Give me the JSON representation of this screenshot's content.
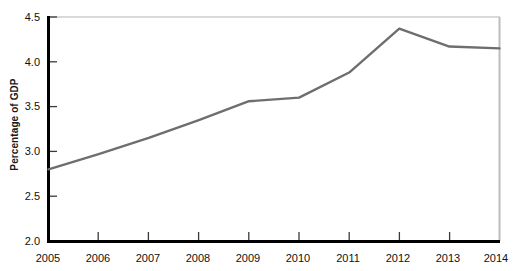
{
  "chart_data": {
    "type": "line",
    "title": "",
    "subtitle": "",
    "xlabel": "",
    "ylabel": "Percentage of GDP",
    "categories": [
      "2005",
      "2006",
      "2007",
      "2008",
      "2009",
      "2010",
      "2011",
      "2012",
      "2013",
      "2014"
    ],
    "x": [
      2005,
      2006,
      2007,
      2008,
      2009,
      2010,
      2011,
      2012,
      2013,
      2014
    ],
    "values": [
      2.8,
      2.97,
      3.15,
      3.35,
      3.56,
      3.6,
      3.88,
      4.37,
      4.17,
      4.15
    ],
    "series": [
      {
        "name": "Percentage of GDP",
        "values": [
          2.8,
          2.97,
          3.15,
          3.35,
          3.56,
          3.6,
          3.88,
          4.37,
          4.17,
          4.15
        ],
        "color": "#6e6e6e"
      }
    ],
    "ylim": [
      2.0,
      4.5
    ],
    "xlim": [
      2005,
      2014
    ],
    "ytick_labels": [
      "2.0",
      "2.5",
      "3.0",
      "3.5",
      "4.0",
      "4.5"
    ],
    "ytick_values": [
      2.0,
      2.5,
      3.0,
      3.5,
      4.0,
      4.5
    ],
    "xtick_labels": [
      "2005",
      "2006",
      "2007",
      "2008",
      "2009",
      "2010",
      "2011",
      "2012",
      "2013",
      "2014"
    ],
    "grid": false,
    "legend": false,
    "legend_position": "none",
    "annotations": [],
    "colors": {
      "line": "#6e6e6e",
      "axis": "#000000",
      "frame": "#c8c8c8",
      "text": "#111111",
      "background": "#ffffff"
    }
  },
  "axes": {
    "y_title": "Percentage of GDP",
    "y_ticks": [
      {
        "label": "4.5",
        "value": 4.5
      },
      {
        "label": "4.0",
        "value": 4.0
      },
      {
        "label": "3.5",
        "value": 3.5
      },
      {
        "label": "3.0",
        "value": 3.0
      },
      {
        "label": "2.5",
        "value": 2.5
      },
      {
        "label": "2.0",
        "value": 2.0
      }
    ],
    "x_ticks": [
      {
        "label": "2005",
        "value": 2005
      },
      {
        "label": "2006",
        "value": 2006
      },
      {
        "label": "2007",
        "value": 2007
      },
      {
        "label": "2008",
        "value": 2008
      },
      {
        "label": "2009",
        "value": 2009
      },
      {
        "label": "2010",
        "value": 2010
      },
      {
        "label": "2011",
        "value": 2011
      },
      {
        "label": "2012",
        "value": 2012
      },
      {
        "label": "2013",
        "value": 2013
      },
      {
        "label": "2014",
        "value": 2014
      }
    ]
  }
}
